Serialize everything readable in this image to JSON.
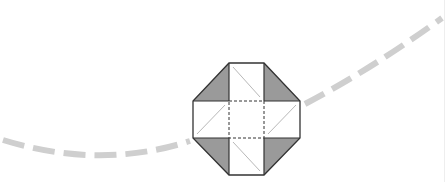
{
  "diagram": {
    "colors": {
      "background": "#ffffff",
      "outline": "#333333",
      "shade": "#9a9a9a",
      "fold_diagonal": "#b8b8b8",
      "dashed_curve": "#cfcfcf"
    },
    "octagon": {
      "points": [
        [
          229,
          63
        ],
        [
          264,
          63
        ],
        [
          300,
          101
        ],
        [
          300,
          138
        ],
        [
          264,
          175
        ],
        [
          229,
          175
        ],
        [
          193,
          138
        ],
        [
          193,
          101
        ]
      ]
    },
    "shaded_triangles": [
      [
        [
          229,
          63
        ],
        [
          229,
          101
        ],
        [
          193,
          101
        ]
      ],
      [
        [
          264,
          63
        ],
        [
          300,
          101
        ],
        [
          264,
          101
        ]
      ],
      [
        [
          193,
          138
        ],
        [
          229,
          138
        ],
        [
          229,
          175
        ]
      ],
      [
        [
          264,
          138
        ],
        [
          300,
          138
        ],
        [
          264,
          175
        ]
      ]
    ],
    "solid_lines": [
      [
        [
          229,
          63
        ],
        [
          229,
          101
        ]
      ],
      [
        [
          264,
          63
        ],
        [
          264,
          101
        ]
      ],
      [
        [
          193,
          101
        ],
        [
          229,
          101
        ]
      ],
      [
        [
          264,
          101
        ],
        [
          300,
          101
        ]
      ],
      [
        [
          193,
          138
        ],
        [
          229,
          138
        ]
      ],
      [
        [
          264,
          138
        ],
        [
          300,
          138
        ]
      ],
      [
        [
          229,
          138
        ],
        [
          229,
          175
        ]
      ],
      [
        [
          264,
          138
        ],
        [
          264,
          175
        ]
      ]
    ],
    "center_square": {
      "x": 229,
      "y": 101,
      "width": 35,
      "height": 37
    },
    "fold_diagonals": [
      [
        [
          233,
          67
        ],
        [
          260,
          97
        ]
      ],
      [
        [
          197,
          134
        ],
        [
          225,
          105
        ]
      ],
      [
        [
          268,
          134
        ],
        [
          296,
          105
        ]
      ],
      [
        [
          233,
          142
        ],
        [
          260,
          171
        ]
      ]
    ],
    "dashed_curve": {
      "left_path": "M3,140 Q100,170 190,141",
      "right_path": "M305,104 Q370,70 442,18",
      "stroke_width": 6,
      "dash": "22,9"
    }
  }
}
